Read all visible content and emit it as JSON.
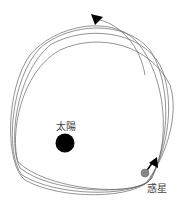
{
  "diagram": {
    "title": "",
    "labels": {
      "sun": "太陽",
      "planet": "惑星"
    },
    "colors": {
      "orbit": "#555555",
      "sun": "#000000",
      "planet": "#888888",
      "arrow": "#000000",
      "background": "#ffffff"
    },
    "orbits_count": 4
  }
}
